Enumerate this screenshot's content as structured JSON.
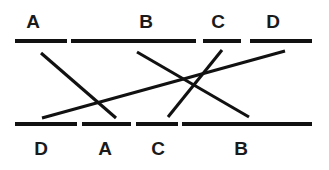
{
  "figure": {
    "type": "matching-diagram",
    "background_color": "#ffffff",
    "ink_color": "#111111",
    "width": 329,
    "height": 170
  },
  "top_row": {
    "label_y": 12,
    "bar_y": 39,
    "bar_height": 4,
    "labels": [
      {
        "text": "A",
        "x": 33
      },
      {
        "text": "B",
        "x": 146
      },
      {
        "text": "C",
        "x": 218
      },
      {
        "text": "D",
        "x": 273
      }
    ],
    "segments": [
      {
        "id": "top-seg-1",
        "x": 15,
        "width": 52
      },
      {
        "id": "top-seg-2",
        "x": 71,
        "width": 125
      },
      {
        "id": "top-seg-3",
        "x": 203,
        "width": 38
      },
      {
        "id": "top-seg-4",
        "x": 250,
        "width": 62
      }
    ]
  },
  "bottom_row": {
    "label_y": 139,
    "bar_y": 122,
    "bar_height": 4,
    "labels": [
      {
        "text": "D",
        "x": 41
      },
      {
        "text": "A",
        "x": 105
      },
      {
        "text": "C",
        "x": 158
      },
      {
        "text": "B",
        "x": 241
      }
    ],
    "segments": [
      {
        "id": "bottom-seg-1",
        "x": 15,
        "width": 62
      },
      {
        "id": "bottom-seg-2",
        "x": 82,
        "width": 49
      },
      {
        "id": "bottom-seg-3",
        "x": 136,
        "width": 42
      },
      {
        "id": "bottom-seg-4",
        "x": 182,
        "width": 130
      }
    ]
  },
  "connectors": [
    {
      "id": "connector-1",
      "x1": 41,
      "y1": 53,
      "x2": 116,
      "y2": 118
    },
    {
      "id": "connector-2",
      "x1": 42,
      "y1": 118,
      "x2": 285,
      "y2": 51
    },
    {
      "id": "connector-3",
      "x1": 137,
      "y1": 52,
      "x2": 249,
      "y2": 117
    },
    {
      "id": "connector-4",
      "x1": 168,
      "y1": 117,
      "x2": 222,
      "y2": 50
    }
  ]
}
